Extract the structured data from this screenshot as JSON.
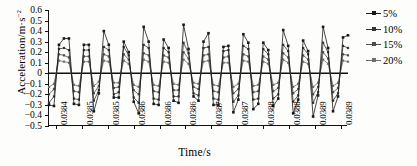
{
  "chart_data": {
    "type": "line",
    "title": "",
    "xlabel": "Time/s",
    "ylabel": "Acceleration/m·s⁻²",
    "ylabel_main": "Acceleration/m·s",
    "ylabel_exp": "−2",
    "ylim": [
      -0.5,
      0.6
    ],
    "yticks": [
      0.6,
      0.5,
      0.4,
      0.3,
      0.2,
      0.1,
      0.0,
      -0.1,
      -0.2,
      -0.3,
      -0.4,
      -0.5
    ],
    "ytick_labels": [
      "0.6",
      "0.5",
      "0.4",
      "0.3",
      "0.2",
      "0.1",
      "0",
      "−0.1",
      "−0.2",
      "−0.3",
      "−0.4",
      "−0.5"
    ],
    "grid": false,
    "legend_position": "right",
    "xtick_labels": [
      "0.0384",
      "0.0385",
      "0.0385",
      "0.0386",
      "0.0386",
      "0.0386",
      "0.0387",
      "0.0387",
      "0.0388",
      "0.0388",
      "0.0389",
      "0.0389"
    ],
    "xtick_positions": [
      0.022,
      0.11,
      0.196,
      0.283,
      0.37,
      0.456,
      0.543,
      0.629,
      0.716,
      0.803,
      0.889,
      0.975
    ],
    "xlim_labels": [
      "0.0384",
      "0.0389"
    ],
    "n_points": 61,
    "x": [
      0,
      1,
      2,
      3,
      4,
      5,
      6,
      7,
      8,
      9,
      10,
      11,
      12,
      13,
      14,
      15,
      16,
      17,
      18,
      19,
      20,
      21,
      22,
      23,
      24,
      25,
      26,
      27,
      28,
      29,
      30,
      31,
      32,
      33,
      34,
      35,
      36,
      37,
      38,
      39,
      40,
      41,
      42,
      43,
      44,
      45,
      46,
      47,
      48,
      49,
      50,
      51,
      52,
      53,
      54,
      55,
      56,
      57,
      58,
      59,
      60
    ],
    "series": [
      {
        "name": "5%",
        "marker": "square",
        "color": "#1a1a1a",
        "values": [
          -0.3,
          -0.31,
          0.27,
          0.33,
          0.33,
          -0.29,
          -0.3,
          0.27,
          0.27,
          -0.36,
          -0.19,
          0.4,
          0.27,
          -0.23,
          -0.23,
          0.3,
          0.2,
          -0.27,
          -0.38,
          0.44,
          0.3,
          -0.29,
          -0.3,
          0.32,
          0.24,
          -0.26,
          -0.28,
          0.46,
          0.23,
          -0.22,
          -0.26,
          0.3,
          0.38,
          -0.3,
          -0.3,
          0.25,
          0.26,
          -0.37,
          -0.25,
          0.37,
          0.29,
          -0.34,
          -0.29,
          0.29,
          0.22,
          -0.31,
          -0.24,
          0.41,
          0.26,
          -0.38,
          -0.25,
          0.31,
          0.21,
          -0.41,
          -0.21,
          0.44,
          0.24,
          -0.36,
          -0.22,
          0.34,
          0.36
        ]
      },
      {
        "name": "10%",
        "marker": "square",
        "color": "#333333",
        "values": [
          -0.28,
          -0.22,
          0.23,
          0.24,
          0.22,
          -0.24,
          -0.25,
          0.22,
          0.22,
          -0.26,
          -0.16,
          0.25,
          0.22,
          -0.2,
          -0.18,
          0.25,
          0.17,
          -0.23,
          -0.28,
          0.27,
          0.24,
          -0.24,
          -0.25,
          0.24,
          0.2,
          -0.22,
          -0.22,
          0.29,
          0.19,
          -0.19,
          -0.21,
          0.24,
          0.25,
          -0.24,
          -0.25,
          0.21,
          0.22,
          -0.27,
          -0.21,
          0.26,
          0.23,
          -0.25,
          -0.24,
          0.23,
          0.18,
          -0.24,
          -0.2,
          0.27,
          0.21,
          -0.27,
          -0.21,
          0.24,
          0.18,
          -0.28,
          -0.18,
          0.29,
          0.2,
          -0.26,
          -0.19,
          0.26,
          0.24
        ]
      },
      {
        "name": "15%",
        "marker": "square",
        "color": "#4d4d4d",
        "values": [
          -0.2,
          -0.15,
          0.18,
          0.17,
          0.15,
          -0.17,
          -0.18,
          0.16,
          0.16,
          -0.19,
          -0.12,
          0.18,
          0.16,
          -0.14,
          -0.13,
          0.18,
          0.13,
          -0.16,
          -0.2,
          0.19,
          0.17,
          -0.17,
          -0.18,
          0.17,
          0.15,
          -0.16,
          -0.16,
          0.2,
          0.14,
          -0.13,
          -0.15,
          0.17,
          0.18,
          -0.17,
          -0.18,
          0.15,
          0.16,
          -0.19,
          -0.15,
          0.18,
          0.16,
          -0.18,
          -0.17,
          0.16,
          0.13,
          -0.17,
          -0.14,
          0.19,
          0.15,
          -0.19,
          -0.15,
          0.17,
          0.13,
          -0.2,
          -0.13,
          0.2,
          0.14,
          -0.18,
          -0.14,
          0.18,
          0.17
        ]
      },
      {
        "name": "20%",
        "marker": "square",
        "color": "#707070",
        "values": [
          -0.13,
          -0.1,
          0.12,
          0.11,
          0.1,
          -0.11,
          -0.12,
          0.11,
          0.11,
          -0.12,
          -0.08,
          0.12,
          0.11,
          -0.09,
          -0.09,
          0.12,
          0.09,
          -0.11,
          -0.13,
          0.13,
          0.11,
          -0.11,
          -0.12,
          0.11,
          0.1,
          -0.1,
          -0.11,
          0.13,
          0.09,
          -0.09,
          -0.1,
          0.11,
          0.12,
          -0.11,
          -0.12,
          0.1,
          0.1,
          -0.13,
          -0.1,
          0.12,
          0.11,
          -0.12,
          -0.11,
          0.11,
          0.09,
          -0.11,
          -0.09,
          0.13,
          0.1,
          -0.13,
          -0.1,
          0.11,
          0.09,
          -0.13,
          -0.09,
          0.13,
          0.09,
          -0.12,
          -0.09,
          0.12,
          0.11
        ]
      }
    ],
    "legend": [
      "5%",
      "10%",
      "15%",
      "20%"
    ]
  }
}
